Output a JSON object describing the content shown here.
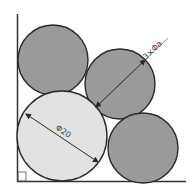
{
  "diagram": {
    "labels": {
      "small_circles": "3×Φa",
      "big_circle": "Φ20"
    },
    "colors": {
      "small_fill": "#9a9a9a",
      "big_fill": "#e2e2e2",
      "stroke": "#2a2a2a"
    },
    "shapes": {
      "small_circle_count": 3,
      "big_circle_count": 1,
      "right_angle_marker": true
    }
  }
}
